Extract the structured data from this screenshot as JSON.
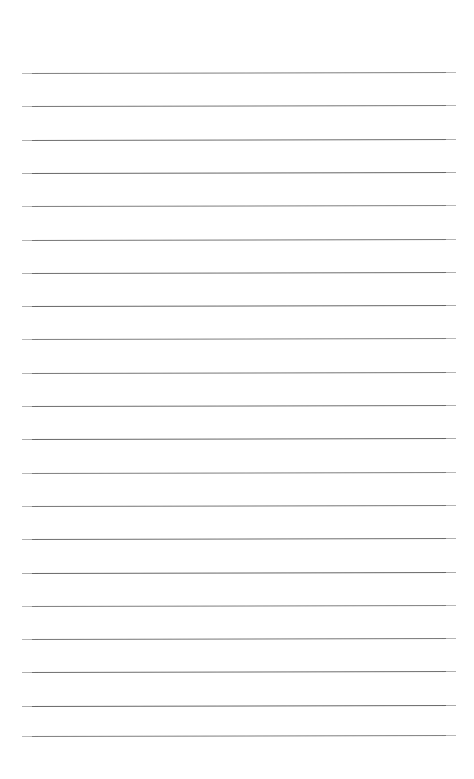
{
  "document": {
    "kind": "lined-paper",
    "title": "",
    "body_text": "",
    "header_text": "",
    "footer_text": "",
    "page_number": "",
    "width_px": 474,
    "height_px": 779,
    "background_color": "#ffffff"
  },
  "ruling": {
    "line_count": 20,
    "line_color": "#5f5f5f",
    "line_thickness_px": 1,
    "first_line_y": 73,
    "line_spacing_px": 33.3,
    "left_margin_x": 22,
    "right_edge_x": 456,
    "line_length_px": 434,
    "slant_deg": -0.13,
    "top_margin_px": 73,
    "bottom_margin_px": 43,
    "lines": [
      {
        "index": 1,
        "y": 73.0,
        "content": ""
      },
      {
        "index": 2,
        "y": 106.3,
        "content": ""
      },
      {
        "index": 3,
        "y": 139.6,
        "content": ""
      },
      {
        "index": 4,
        "y": 172.9,
        "content": ""
      },
      {
        "index": 5,
        "y": 206.2,
        "content": ""
      },
      {
        "index": 6,
        "y": 239.5,
        "content": ""
      },
      {
        "index": 7,
        "y": 272.8,
        "content": ""
      },
      {
        "index": 8,
        "y": 306.1,
        "content": ""
      },
      {
        "index": 9,
        "y": 339.4,
        "content": ""
      },
      {
        "index": 10,
        "y": 372.7,
        "content": ""
      },
      {
        "index": 11,
        "y": 406.0,
        "content": ""
      },
      {
        "index": 12,
        "y": 439.3,
        "content": ""
      },
      {
        "index": 13,
        "y": 472.6,
        "content": ""
      },
      {
        "index": 14,
        "y": 505.9,
        "content": ""
      },
      {
        "index": 15,
        "y": 539.2,
        "content": ""
      },
      {
        "index": 16,
        "y": 572.5,
        "content": ""
      },
      {
        "index": 17,
        "y": 605.8,
        "content": ""
      },
      {
        "index": 18,
        "y": 639.1,
        "content": ""
      },
      {
        "index": 19,
        "y": 672.4,
        "content": ""
      },
      {
        "index": 20,
        "y": 705.7,
        "content": ""
      },
      {
        "index": 21,
        "y": 736.0,
        "content": ""
      }
    ]
  }
}
